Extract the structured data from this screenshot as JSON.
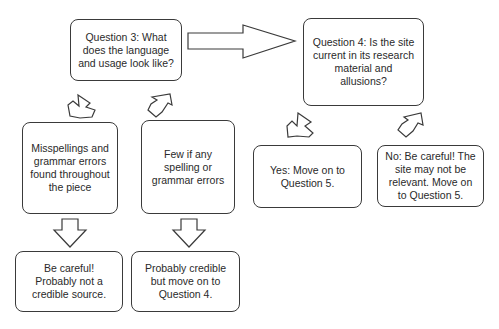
{
  "diagram": {
    "type": "flowchart",
    "nodes": {
      "q3": {
        "label": "Question 3: What does the language and usage look like?"
      },
      "q4": {
        "label": "Question 4: Is the site current in its research material and allusions?"
      },
      "misspellings": {
        "label": "Misspellings and grammar errors found throughout the piece"
      },
      "few_errors": {
        "label": "Few if any spelling or grammar errors"
      },
      "not_credible": {
        "label": "Be careful! Probably not a credible source."
      },
      "probably_credible": {
        "label": "Probably credible but move on to Question 4."
      },
      "yes": {
        "label": "Yes: Move on to Question 5."
      },
      "no": {
        "label": "No: Be careful! The site may not be relevant. Move on to Question 5."
      }
    },
    "edges": [
      {
        "from": "q3",
        "to": "q4",
        "icon": "right-arrow-icon"
      },
      {
        "from": "q3",
        "to": "misspellings",
        "icon": "diagonal-down-left-arrow-icon"
      },
      {
        "from": "q3",
        "to": "few_errors",
        "icon": "diagonal-down-right-arrow-icon"
      },
      {
        "from": "misspellings",
        "to": "not_credible",
        "icon": "down-arrow-icon"
      },
      {
        "from": "few_errors",
        "to": "probably_credible",
        "icon": "down-arrow-icon"
      },
      {
        "from": "q4",
        "to": "yes",
        "icon": "diagonal-down-left-arrow-icon"
      },
      {
        "from": "q4",
        "to": "no",
        "icon": "diagonal-down-right-arrow-icon"
      }
    ],
    "colors": {
      "stroke": "#3a3a3a",
      "fill": "#ffffff",
      "text": "#2a2a2a"
    }
  }
}
